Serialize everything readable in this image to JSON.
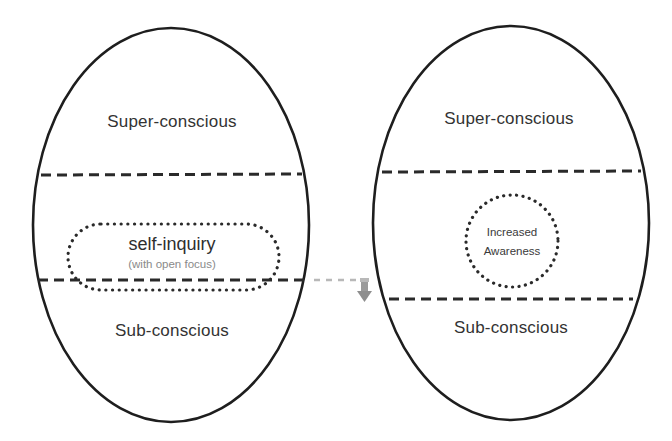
{
  "colors": {
    "outline": "#1e1e1e",
    "text": "#333333",
    "subtext": "#8a8a8a",
    "arrow": "#b0b0b0",
    "background": "#ffffff"
  },
  "left_panel": {
    "top_region": "Super-conscious",
    "focus": {
      "title": "self-inquiry",
      "subtitle": "(with open focus)"
    },
    "bottom_region": "Sub-conscious"
  },
  "transition": {
    "icon": "dashed-arrow-down-right"
  },
  "right_panel": {
    "top_region": "Super-conscious",
    "focus": {
      "line1": "Increased",
      "line2": "Awareness"
    },
    "bottom_region": "Sub-conscious"
  }
}
